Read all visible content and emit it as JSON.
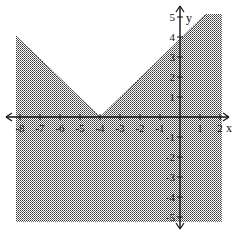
{
  "chart_data": {
    "type": "area",
    "title": "",
    "boundary": {
      "equation": "y = |x + 4|",
      "vertex": [
        -4,
        0
      ],
      "line_style": "dashed",
      "points": [
        [
          -8,
          4.2
        ],
        [
          -4,
          0
        ],
        [
          1.3,
          5.3
        ],
        [
          2.2,
          5.3
        ]
      ]
    },
    "shading": "below",
    "xlabel": "x",
    "ylabel": "y",
    "xlim": [
      -8.2,
      2.2
    ],
    "ylim": [
      -5.3,
      5.3
    ],
    "x_ticks": [
      "-8",
      "-7",
      "-6",
      "-5",
      "-4",
      "-3",
      "-2",
      "-1",
      "1",
      "2"
    ],
    "y_ticks": [
      "5",
      "4",
      "3",
      "2",
      "1",
      "-1",
      "-2",
      "-3",
      "-4",
      "-5"
    ],
    "grid": false,
    "legend": null
  },
  "axes": {
    "x_label": "x",
    "y_label": "y"
  }
}
